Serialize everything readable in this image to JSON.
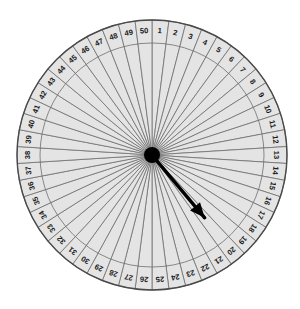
{
  "figure": {
    "kind": "spinner-wheel",
    "sector_count": 50,
    "sector_labels": [
      "1",
      "2",
      "3",
      "4",
      "5",
      "6",
      "7",
      "8",
      "9",
      "10",
      "11",
      "12",
      "13",
      "14",
      "15",
      "16",
      "17",
      "18",
      "19",
      "20",
      "21",
      "22",
      "23",
      "24",
      "25",
      "26",
      "27",
      "28",
      "29",
      "30",
      "31",
      "32",
      "33",
      "34",
      "35",
      "36",
      "37",
      "38",
      "39",
      "40",
      "41",
      "42",
      "43",
      "44",
      "45",
      "46",
      "47",
      "48",
      "49",
      "50"
    ],
    "pointer": {
      "name": "spinner-arrow",
      "points_to_label": "20",
      "angle_deg_clockwise_from_top": 140
    },
    "colors": {
      "sector_fill": "#e4e4e4",
      "sector_stroke": "#6e6e6e",
      "rim_stroke": "#4a4a4a",
      "label_text": "#1a1a1a",
      "hub": "#000000",
      "pointer": "#000000",
      "background": "#ffffff"
    },
    "geometry": {
      "center_x": 152,
      "center_y": 155,
      "outer_radius": 135,
      "band_inner_radius": 112,
      "hub_radius": 8,
      "label_radius": 124
    }
  },
  "chart_data": {
    "type": "pie",
    "title": "",
    "xlabel": "",
    "ylabel": "",
    "categories": [
      "1",
      "2",
      "3",
      "4",
      "5",
      "6",
      "7",
      "8",
      "9",
      "10",
      "11",
      "12",
      "13",
      "14",
      "15",
      "16",
      "17",
      "18",
      "19",
      "20",
      "21",
      "22",
      "23",
      "24",
      "25",
      "26",
      "27",
      "28",
      "29",
      "30",
      "31",
      "32",
      "33",
      "34",
      "35",
      "36",
      "37",
      "38",
      "39",
      "40",
      "41",
      "42",
      "43",
      "44",
      "45",
      "46",
      "47",
      "48",
      "49",
      "50"
    ],
    "values": [
      1,
      1,
      1,
      1,
      1,
      1,
      1,
      1,
      1,
      1,
      1,
      1,
      1,
      1,
      1,
      1,
      1,
      1,
      1,
      1,
      1,
      1,
      1,
      1,
      1,
      1,
      1,
      1,
      1,
      1,
      1,
      1,
      1,
      1,
      1,
      1,
      1,
      1,
      1,
      1,
      1,
      1,
      1,
      1,
      1,
      1,
      1,
      1,
      1,
      1
    ],
    "slice_angle_deg": 7.2,
    "start_angle_deg": 0,
    "direction": "clockwise",
    "legend": "none",
    "grid": false,
    "annotations": [
      "pointer arrow indicating sector 20"
    ]
  }
}
